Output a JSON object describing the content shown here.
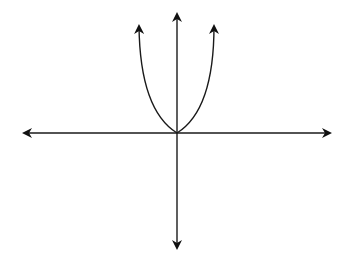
{
  "diagram": {
    "type": "coordinate-plane-parabola",
    "colors": {
      "background": "#ffffff",
      "stroke": "#1a1a1a",
      "arrowhead": "#111111"
    },
    "origin": {
      "x": 177,
      "y": 133
    },
    "axes": {
      "x_axis": {
        "from": [
          22,
          133
        ],
        "to": [
          332,
          133
        ],
        "arrows": "both"
      },
      "y_axis": {
        "from": [
          177,
          250
        ],
        "to": [
          177,
          12
        ],
        "arrows": "both"
      }
    },
    "curve": {
      "kind": "parabola",
      "equation_form": "y = a x^2",
      "vertex": [
        177,
        133
      ],
      "left_end": [
        139,
        24
      ],
      "right_end": [
        214,
        24
      ],
      "arrows": "both-ends"
    },
    "labels": []
  }
}
